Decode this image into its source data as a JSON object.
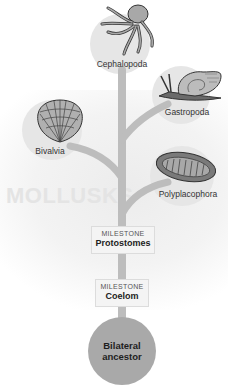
{
  "diagram": {
    "watermark": "MOLLUSKS",
    "branches": [
      {
        "id": "cephalopoda",
        "label": "Cephalopoda",
        "icon": "octopus-icon"
      },
      {
        "id": "gastropoda",
        "label": "Gastropoda",
        "icon": "snail-icon"
      },
      {
        "id": "bivalvia",
        "label": "Bivalvia",
        "icon": "scallop-shell-icon"
      },
      {
        "id": "polyplacophora",
        "label": "Polyplacophora",
        "icon": "chiton-icon"
      }
    ],
    "milestones": [
      {
        "kicker": "MILESTONE",
        "title": "Protostomes"
      },
      {
        "kicker": "MILESTONE",
        "title": "Coelom"
      }
    ],
    "root": {
      "line1": "Bilateral",
      "line2": "ancestor"
    },
    "colors": {
      "trunk": "#bdbdbd",
      "node_bg": "#e6e6e6",
      "root_bg": "#a9a9a9",
      "watermark": "#e4e4e4"
    }
  }
}
